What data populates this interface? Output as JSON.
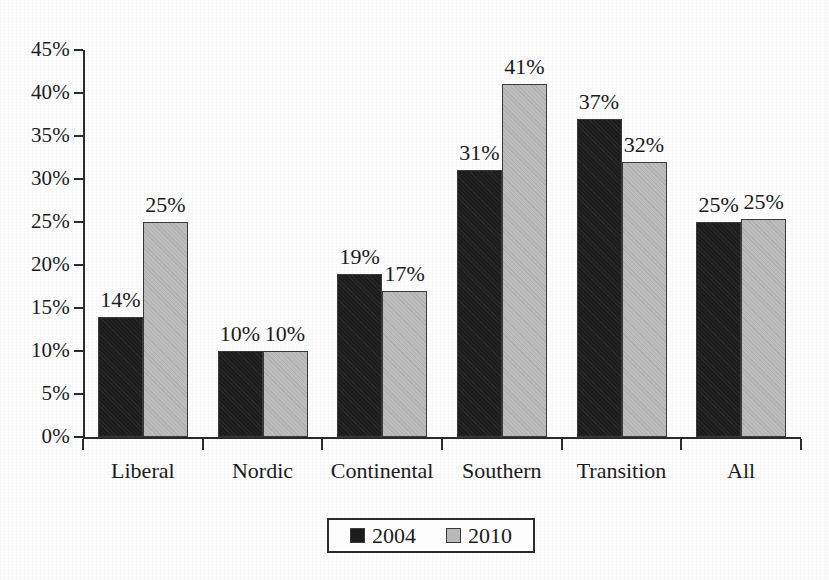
{
  "chart_data": {
    "type": "bar",
    "title": "",
    "subtitle": "",
    "xlabel": "",
    "ylabel": "",
    "categories": [
      "Liberal",
      "Nordic",
      "Continental",
      "Southern",
      "Transition",
      "All"
    ],
    "series": [
      {
        "name": "2004",
        "color": "#1c1c1c",
        "values": [
          14,
          10,
          19,
          31,
          37,
          25
        ],
        "labels": [
          "14%",
          "10%",
          "19%",
          "31%",
          "37%",
          "25%"
        ]
      },
      {
        "name": "2010",
        "color": "#b9b9b9",
        "values": [
          25,
          10,
          17,
          41,
          32,
          25.4
        ],
        "labels": [
          "25%",
          "10%",
          "17%",
          "41%",
          "32%",
          "25%"
        ]
      }
    ],
    "ylim": [
      0,
      45
    ],
    "ytick_step": 5,
    "ytick_labels": [
      "0%",
      "5%",
      "10%",
      "15%",
      "20%",
      "25%",
      "30%",
      "35%",
      "40%",
      "45%"
    ],
    "ytick_values": [
      0,
      5,
      10,
      15,
      20,
      25,
      30,
      35,
      40,
      45
    ],
    "grid": false,
    "value_labels_shown": true,
    "legend": {
      "position": "bottom-center",
      "bordered": true,
      "entries": [
        {
          "label": "2004",
          "color": "#1c1c1c"
        },
        {
          "label": "2010",
          "color": "#b9b9b9"
        }
      ]
    }
  }
}
